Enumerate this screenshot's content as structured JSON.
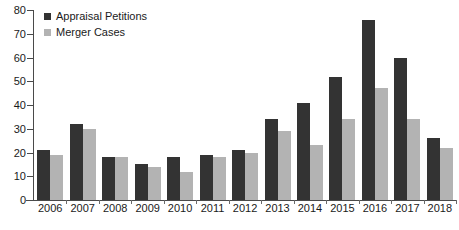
{
  "chart_data": {
    "type": "bar",
    "title": "",
    "subtitle": "",
    "xlabel": "",
    "ylabel": "",
    "ylim": [
      0,
      80
    ],
    "y_ticks": [
      0,
      10,
      20,
      30,
      40,
      50,
      60,
      70,
      80
    ],
    "grid": false,
    "legend_position": "top-left",
    "categories": [
      "2006",
      "2007",
      "2008",
      "2009",
      "2010",
      "2011",
      "2012",
      "2013",
      "2014",
      "2015",
      "2016",
      "2017",
      "2018"
    ],
    "series": [
      {
        "name": "Appraisal Petitions",
        "color": "#333333",
        "values": [
          21,
          32,
          18,
          15,
          18,
          19,
          21,
          34,
          41,
          52,
          76,
          60,
          26
        ]
      },
      {
        "name": "Merger Cases",
        "color": "#b3b3b3",
        "values": [
          19,
          30,
          18,
          14,
          12,
          18,
          20,
          29,
          23,
          34,
          47,
          34,
          22
        ]
      }
    ]
  },
  "axis": {
    "line_color": "#4a4a4a"
  }
}
